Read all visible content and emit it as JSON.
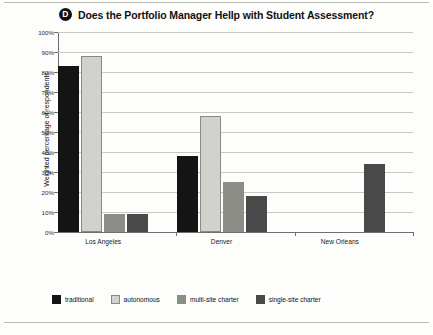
{
  "figure": {
    "panel_letter": "D",
    "title": "Does the Portfolio Manager Hellp with Student Assessment?"
  },
  "axes": {
    "y_title": "Weighted percentage of respondents",
    "y_ticks": [
      "100%",
      "90%",
      "80%",
      "70%",
      "60%",
      "50%",
      "40%",
      "30%",
      "20%",
      "10%",
      "0%"
    ]
  },
  "legend": {
    "items": [
      {
        "label": "traditional",
        "color": "#141414"
      },
      {
        "label": "autonomous",
        "color": "#d2d2cd"
      },
      {
        "label": "multi-site charter",
        "color": "#8d8d88"
      },
      {
        "label": "single-site charter",
        "color": "#494949"
      }
    ]
  },
  "chart_data": {
    "type": "bar",
    "title": "Does the Portfolio Manager Hellp with Student Assessment?",
    "xlabel": "",
    "ylabel": "Weighted percentage of respondents",
    "ylim": [
      0,
      100
    ],
    "ytick_step": 10,
    "grid": true,
    "legend_position": "bottom",
    "categories": [
      "Los Angeles",
      "Denver",
      "New Orleans"
    ],
    "series": [
      {
        "name": "traditional",
        "color": "#141414",
        "values": [
          83,
          38,
          null
        ]
      },
      {
        "name": "autonomous",
        "color": "#d2d2cd",
        "values": [
          88,
          58,
          null
        ]
      },
      {
        "name": "multi-site charter",
        "color": "#8d8d88",
        "values": [
          9,
          25,
          null
        ]
      },
      {
        "name": "single-site charter",
        "color": "#494949",
        "values": [
          9,
          18,
          34
        ]
      }
    ]
  }
}
